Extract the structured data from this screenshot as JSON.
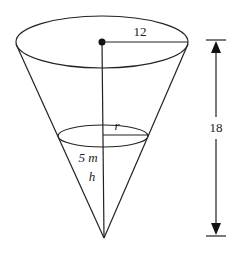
{
  "diagram": {
    "type": "inverted-cone",
    "labels": {
      "top_radius": "12",
      "height": "18",
      "water_radius": "r",
      "water_depth_value": "5 m",
      "water_depth_var": "h"
    },
    "colors": {
      "line": "#222222",
      "background": "#ffffff"
    }
  }
}
